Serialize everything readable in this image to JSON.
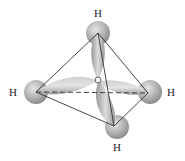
{
  "diagram": {
    "center_atom": "C",
    "atoms": [
      {
        "label": "H",
        "position": "top"
      },
      {
        "label": "H",
        "position": "left"
      },
      {
        "label": "H",
        "position": "right"
      },
      {
        "label": "H",
        "position": "bottom"
      }
    ],
    "colors": {
      "orbital": "#b5b5b5",
      "orbital_highlight": "#e2e2e2",
      "edge": "#333333"
    }
  }
}
